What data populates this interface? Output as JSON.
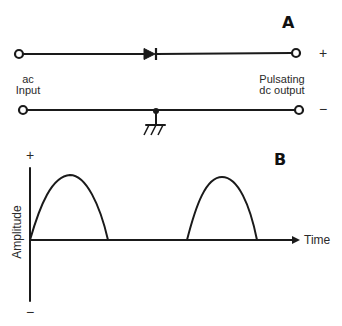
{
  "panel_a": {
    "letter": "A",
    "input_label_line1": "ac",
    "input_label_line2": "Input",
    "output_label_line1": "Pulsating",
    "output_label_line2": "dc output",
    "positive_sign": "+",
    "negative_sign": "−",
    "components": [
      "diode",
      "ground",
      "junction-dot",
      "input-terminal-top",
      "input-terminal-bottom",
      "output-terminal-top",
      "output-terminal-bottom"
    ]
  },
  "panel_b": {
    "letter": "B",
    "y_axis_label": "Amplitude",
    "x_axis_label": "Time",
    "y_positive_sign": "+",
    "y_negative_sign": "−",
    "waveform": "half-wave rectified sine (positive half-cycles only)"
  },
  "colors": {
    "ink": "#1a1a1a",
    "background": "#ffffff"
  }
}
